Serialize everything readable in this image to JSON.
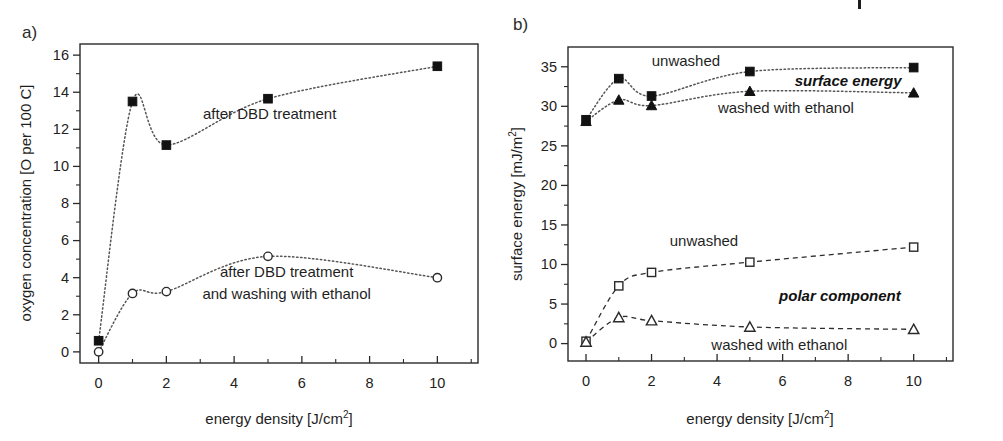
{
  "figure": {
    "width": 1003,
    "height": 441,
    "background": "#ffffff",
    "ink_color": "#1f1f1f"
  },
  "panels": [
    {
      "id": "panel-a",
      "letter": "a)",
      "xlabel_main": "energy density [J/cm",
      "xlabel_sup": "2",
      "xlabel_tail": "]",
      "ylabel": "oxygen concentration [O per 100 C]"
    },
    {
      "id": "panel-b",
      "letter": "b)",
      "xlabel_main": "energy density [J/cm",
      "xlabel_sup": "2",
      "xlabel_tail": "]",
      "ylabel_main": "surface energy [mJ/m",
      "ylabel_sup": "2",
      "ylabel_tail": "]"
    }
  ],
  "chart_data": [
    {
      "id": "panel-a",
      "type": "scatter",
      "title": "a)",
      "xlabel": "energy density [J/cm2]",
      "ylabel": "oxygen concentration [O per 100 C]",
      "xlim": [
        -0.55,
        11.2
      ],
      "ylim": [
        -0.6,
        16.6
      ],
      "xticks": [
        0,
        2,
        4,
        6,
        8,
        10
      ],
      "xticks_minor": [
        1,
        3,
        5,
        7,
        9,
        11
      ],
      "yticks": [
        0,
        2,
        4,
        6,
        8,
        10,
        12,
        14,
        16
      ],
      "yticks_minor": [
        1,
        3,
        5,
        7,
        9,
        11,
        13,
        15
      ],
      "grid": false,
      "legend": "annotations-inline",
      "series": [
        {
          "name": "after DBD treatment",
          "marker": "filled-square",
          "line": "dotted",
          "x": [
            0,
            1,
            2,
            5,
            10
          ],
          "values": [
            0.6,
            13.5,
            11.15,
            13.65,
            15.4
          ]
        },
        {
          "name": "after DBD treatment and washing with ethanol",
          "marker": "open-circle",
          "line": "dotted",
          "x": [
            0,
            1,
            2,
            5,
            10
          ],
          "values": [
            0.0,
            3.15,
            3.25,
            5.15,
            4.0
          ]
        }
      ],
      "annotations": [
        {
          "text": "after DBD treatment",
          "x": 5.05,
          "y": 12.55
        },
        {
          "text": "after DBD treatment",
          "x": 5.55,
          "y": 4.05
        },
        {
          "text": "and washing with ethanol",
          "x": 5.55,
          "y": 2.85
        }
      ]
    },
    {
      "id": "panel-b",
      "type": "scatter",
      "title": "b)",
      "xlabel": "energy density [J/cm2]",
      "ylabel": "surface energy [mJ/m2]",
      "xlim": [
        -0.55,
        11.2
      ],
      "ylim": [
        -2.2,
        37.5
      ],
      "xticks": [
        0,
        2,
        4,
        6,
        8,
        10
      ],
      "xticks_minor": [
        1,
        3,
        5,
        7,
        9,
        11
      ],
      "yticks": [
        0,
        5,
        10,
        15,
        20,
        25,
        30,
        35
      ],
      "yticks_minor": [
        2.5,
        7.5,
        12.5,
        17.5,
        22.5,
        27.5,
        32.5,
        37.5
      ],
      "grid": false,
      "legend": "annotations-inline",
      "series": [
        {
          "name": "surface energy unwashed",
          "group": "surface energy",
          "marker": "filled-square",
          "line": "dotted",
          "x": [
            0,
            1,
            2,
            5,
            10
          ],
          "values": [
            28.3,
            33.5,
            31.3,
            34.4,
            34.9
          ]
        },
        {
          "name": "surface energy washed with ethanol",
          "group": "surface energy",
          "marker": "filled-triangle",
          "line": "dotted",
          "x": [
            0,
            1,
            2,
            5,
            10
          ],
          "values": [
            28.1,
            30.8,
            30.1,
            31.9,
            31.7
          ]
        },
        {
          "name": "polar component unwashed",
          "group": "polar component",
          "marker": "open-square",
          "line": "dashed",
          "x": [
            0,
            1,
            2,
            5,
            10
          ],
          "values": [
            0.3,
            7.3,
            9.0,
            10.3,
            12.2
          ]
        },
        {
          "name": "polar component washed with ethanol",
          "group": "polar component",
          "marker": "open-triangle",
          "line": "dashed",
          "x": [
            0,
            1,
            2,
            5,
            10
          ],
          "values": [
            0.2,
            3.3,
            2.9,
            2.1,
            1.8
          ]
        }
      ],
      "annotations": [
        {
          "text": "unwashed",
          "x": 3.05,
          "y": 35.1,
          "style": "plain"
        },
        {
          "text": "surface energy",
          "x": 8.0,
          "y": 32.6,
          "style": "bold-italic"
        },
        {
          "text": "washed with ethanol",
          "x": 6.1,
          "y": 29.2,
          "style": "plain"
        },
        {
          "text": "unwashed",
          "x": 3.6,
          "y": 12.4,
          "style": "plain"
        },
        {
          "text": "polar component",
          "x": 7.75,
          "y": 5.4,
          "style": "bold-italic"
        },
        {
          "text": "washed with ethanol",
          "x": 5.9,
          "y": -0.8,
          "style": "plain"
        }
      ]
    }
  ]
}
